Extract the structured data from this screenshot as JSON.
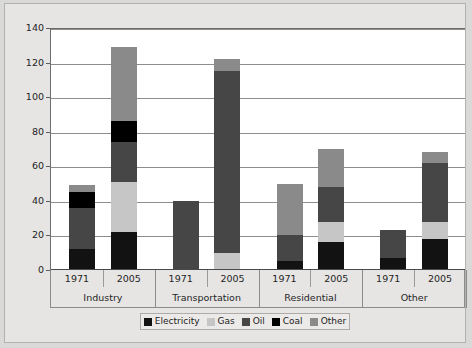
{
  "chart_data": {
    "type": "bar",
    "title": "",
    "xlabel": "",
    "ylabel": "",
    "ylim": [
      0,
      140
    ],
    "yticks": [
      0,
      20,
      40,
      60,
      80,
      100,
      120,
      140
    ],
    "grid": true,
    "stacked": true,
    "legend_position": "bottom",
    "groups": [
      "Industry",
      "Transportation",
      "Residential",
      "Other"
    ],
    "years": [
      "1971",
      "2005"
    ],
    "categories": [
      "Industry 1971",
      "Industry 2005",
      "Transportation 1971",
      "Transportation 2005",
      "Residential 1971",
      "Residential 2005",
      "Other 1971",
      "Other 2005"
    ],
    "series": [
      {
        "name": "Electricity",
        "color": "#121212",
        "values": [
          12,
          22,
          0,
          0,
          5,
          16,
          7,
          18
        ]
      },
      {
        "name": "Gas",
        "color": "#c6c6c6",
        "values": [
          0,
          29,
          0,
          10,
          0,
          12,
          0,
          10
        ]
      },
      {
        "name": "Oil",
        "color": "#464646",
        "values": [
          24,
          23,
          40,
          105,
          15,
          20,
          16,
          34
        ]
      },
      {
        "name": "Coal",
        "color": "#000000",
        "values": [
          9,
          12,
          0,
          0,
          0,
          0,
          0,
          0
        ]
      },
      {
        "name": "Other",
        "color": "#8a8a8a",
        "values": [
          4,
          43,
          0,
          7,
          30,
          22,
          0,
          6
        ]
      }
    ],
    "totals": [
      49,
      129,
      40,
      122,
      50,
      70,
      23,
      68
    ]
  },
  "legend": {
    "items": [
      {
        "label": "Electricity",
        "color": "#121212"
      },
      {
        "label": "Gas",
        "color": "#c6c6c6"
      },
      {
        "label": "Oil",
        "color": "#464646"
      },
      {
        "label": "Coal",
        "color": "#000000"
      },
      {
        "label": "Other",
        "color": "#8a8a8a"
      }
    ]
  },
  "axis": {
    "y_tick_labels": [
      "0",
      "20",
      "40",
      "60",
      "80",
      "100",
      "120",
      "140"
    ]
  },
  "colors": {
    "page_background": "#d9d9d7",
    "card_background": "#e6e5e3",
    "plot_background": "#ffffff",
    "gridline": "#8d8d8d",
    "axis": "#4a4a4a",
    "text": "#1f1f1f"
  }
}
